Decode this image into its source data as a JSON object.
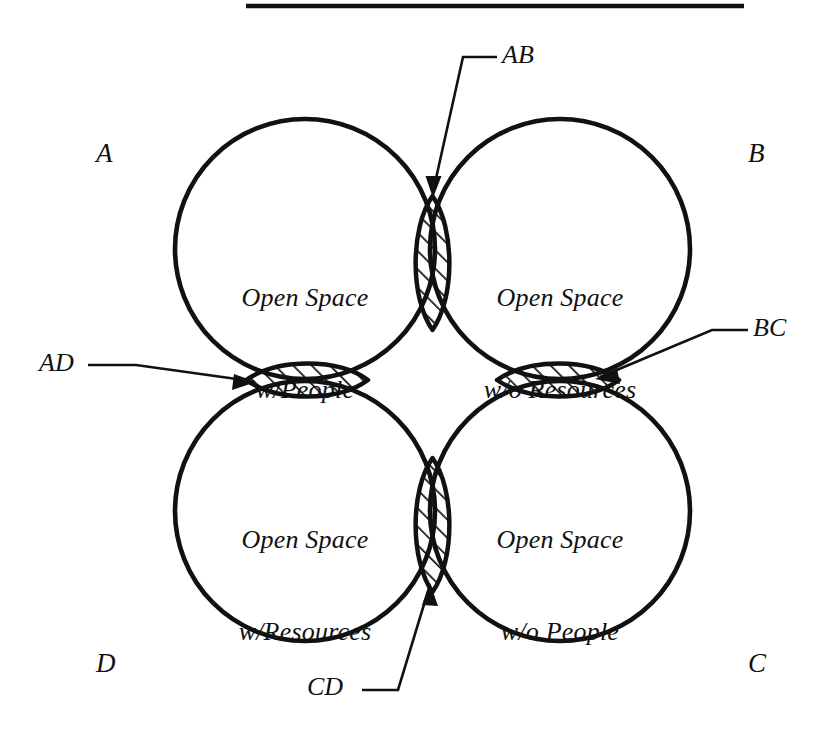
{
  "figure": {
    "type": "four-circle-venn-diagram",
    "top_rule": {
      "name": "horizontal-rule",
      "color": "#111111"
    },
    "background_color": "#ffffff",
    "ink_color": "#111111"
  },
  "regions": [
    {
      "id": "A",
      "corner_label": "A",
      "line1": "Open Space",
      "line2": "w/People"
    },
    {
      "id": "B",
      "corner_label": "B",
      "line1": "Open Space",
      "line2": "w/o Resources"
    },
    {
      "id": "C",
      "corner_label": "C",
      "line1": "Open Space",
      "line2": "w/o People"
    },
    {
      "id": "D",
      "corner_label": "D",
      "line1": "Open Space",
      "line2": "w/Resources"
    }
  ],
  "intersections": [
    {
      "id": "AB",
      "label": "AB",
      "orientation": "vertical",
      "between": "A and B"
    },
    {
      "id": "BC",
      "label": "BC",
      "orientation": "horizontal",
      "between": "B and C"
    },
    {
      "id": "CD",
      "label": "CD",
      "orientation": "vertical",
      "between": "C and D"
    },
    {
      "id": "AD",
      "label": "AD",
      "orientation": "horizontal",
      "between": "A and D"
    }
  ]
}
